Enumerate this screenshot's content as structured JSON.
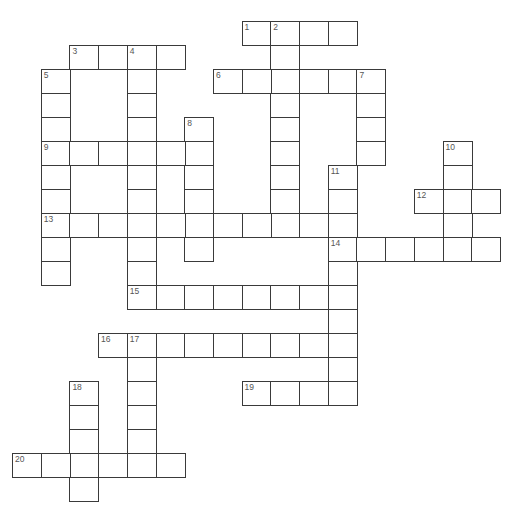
{
  "puzzle": {
    "type": "crossword",
    "grid_geometry": {
      "origin_x": 12,
      "origin_y": 21,
      "cell_w": 28.7,
      "cell_h": 24
    },
    "line_color": "#3a3a3a",
    "number_color": "#555555",
    "words": [
      {
        "num": "1",
        "dir": "across",
        "row": 0,
        "col": 8,
        "len": 4
      },
      {
        "num": "2",
        "dir": "down",
        "row": 0,
        "col": 9,
        "len": 9
      },
      {
        "num": "3",
        "dir": "across",
        "row": 1,
        "col": 2,
        "len": 4
      },
      {
        "num": "4",
        "dir": "down",
        "row": 1,
        "col": 4,
        "len": 11
      },
      {
        "num": "5",
        "dir": "down",
        "row": 2,
        "col": 1,
        "len": 9
      },
      {
        "num": "6",
        "dir": "across",
        "row": 2,
        "col": 7,
        "len": 6
      },
      {
        "num": "7",
        "dir": "down",
        "row": 2,
        "col": 12,
        "len": 4
      },
      {
        "num": "8",
        "dir": "down",
        "row": 4,
        "col": 6,
        "len": 6
      },
      {
        "num": "9",
        "dir": "across",
        "row": 5,
        "col": 1,
        "len": 6
      },
      {
        "num": "10",
        "dir": "down",
        "row": 5,
        "col": 15,
        "len": 5
      },
      {
        "num": "11",
        "dir": "down",
        "row": 6,
        "col": 11,
        "len": 10
      },
      {
        "num": "12",
        "dir": "across",
        "row": 7,
        "col": 14,
        "len": 3
      },
      {
        "num": "13",
        "dir": "across",
        "row": 8,
        "col": 1,
        "len": 11
      },
      {
        "num": "14",
        "dir": "across",
        "row": 9,
        "col": 11,
        "len": 6
      },
      {
        "num": "15",
        "dir": "across",
        "row": 11,
        "col": 4,
        "len": 8
      },
      {
        "num": "16",
        "dir": "across",
        "row": 13,
        "col": 3,
        "len": 9
      },
      {
        "num": "17",
        "dir": "down",
        "row": 13,
        "col": 4,
        "len": 6
      },
      {
        "num": "18",
        "dir": "down",
        "row": 15,
        "col": 2,
        "len": 5
      },
      {
        "num": "19",
        "dir": "across",
        "row": 15,
        "col": 8,
        "len": 4
      },
      {
        "num": "20",
        "dir": "across",
        "row": 18,
        "col": 0,
        "len": 6
      }
    ]
  }
}
